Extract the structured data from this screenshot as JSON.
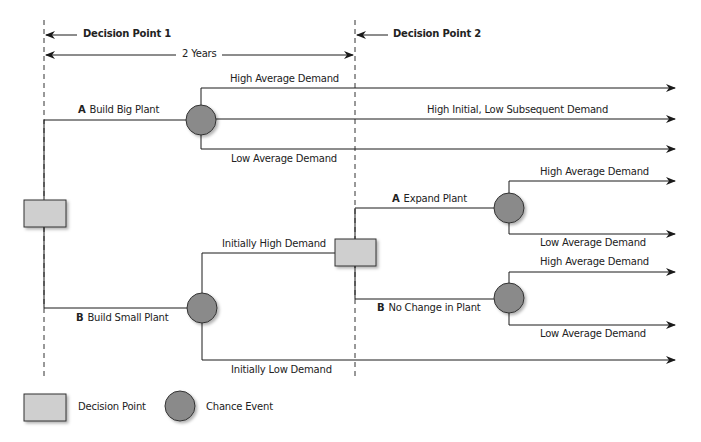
{
  "markers": {
    "decision_point_1": "Decision Point 1",
    "decision_point_2": "Decision Point 2",
    "duration": "2 Years"
  },
  "branches": {
    "big_plant": {
      "letter": "A",
      "label": "Build Big Plant"
    },
    "small_plant": {
      "letter": "B",
      "label": "Build Small Plant"
    },
    "expand_plant": {
      "letter": "A",
      "label": "Expand Plant"
    },
    "no_change": {
      "letter": "B",
      "label": "No Change in Plant"
    }
  },
  "outcomes": {
    "big_high_avg": "High Average Demand",
    "big_high_initial_low_subsequent": "High Initial, Low Subsequent Demand",
    "big_low_avg": "Low Average Demand",
    "small_initially_high": "Initially High Demand",
    "small_initially_low": "Initially Low Demand",
    "expand_high_avg": "High Average Demand",
    "expand_low_avg": "Low Average Demand",
    "nochange_high_avg": "High Average Demand",
    "nochange_low_avg": "Low Average Demand"
  },
  "legend": {
    "decision": "Decision Point",
    "chance": "Chance Event"
  },
  "colors": {
    "decision_fill": "#cfcfcf",
    "chance_fill": "#8a8a8a",
    "line": "#1a1a1a"
  }
}
